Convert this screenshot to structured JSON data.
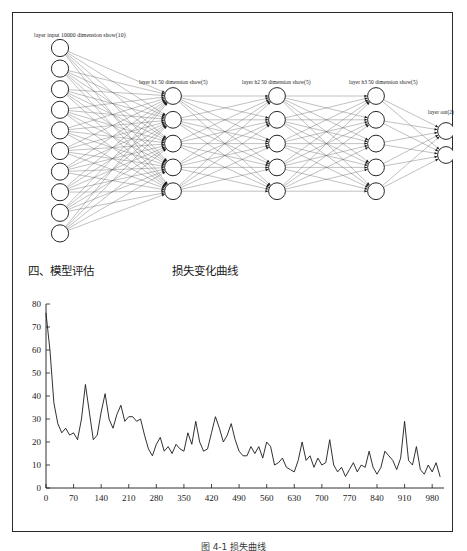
{
  "document": {
    "bottom_caption": "图 4-1  损失曲线"
  },
  "network": {
    "labels": {
      "input": "layer input 10000 dimension show(10)",
      "h1": "layer h1 50 dimension show(5)",
      "h2": "layer h2 50 dimension show(5)",
      "h3": "layer h3 50 dimension show(5)",
      "out": "layer out(2)"
    },
    "layers": [
      {
        "name": "input",
        "node_count": 10,
        "x": 48,
        "y_start": 35,
        "y_step": 20.6,
        "r": 8.6
      },
      {
        "name": "h1",
        "node_count": 5,
        "x": 161,
        "y_start": 83,
        "y_step": 23.8,
        "r": 8.4
      },
      {
        "name": "h2",
        "node_count": 5,
        "x": 265,
        "y_start": 83,
        "y_step": 23.8,
        "r": 8.4
      },
      {
        "name": "h3",
        "node_count": 5,
        "x": 364,
        "y_start": 83,
        "y_step": 23.8,
        "r": 8.4
      },
      {
        "name": "out",
        "node_count": 2,
        "x": 434,
        "y_start": 118,
        "y_step": 24.0,
        "r": 8.4
      }
    ],
    "node_fill": "#ffffff",
    "node_stroke": "#111111",
    "edge_color": "#4a4a4a"
  },
  "headings": {
    "section": "四、模型评估",
    "chart": "损失变化曲线"
  },
  "chart_data": {
    "type": "line",
    "title": "损失变化曲线",
    "xlabel": "",
    "ylabel": "",
    "xlim": [
      0,
      1010
    ],
    "ylim": [
      0,
      80
    ],
    "grid": false,
    "legend": null,
    "xticks": [
      0,
      70,
      140,
      210,
      280,
      350,
      420,
      490,
      560,
      630,
      700,
      770,
      840,
      910,
      980
    ],
    "yticks": [
      0,
      10,
      20,
      30,
      40,
      50,
      60,
      70,
      80
    ],
    "line_color": "#1a1a1a",
    "x": [
      0,
      10,
      20,
      30,
      40,
      50,
      60,
      70,
      80,
      90,
      100,
      110,
      120,
      130,
      140,
      150,
      160,
      170,
      180,
      190,
      200,
      210,
      220,
      230,
      240,
      250,
      260,
      270,
      280,
      290,
      300,
      310,
      320,
      330,
      340,
      350,
      360,
      370,
      380,
      390,
      400,
      410,
      420,
      430,
      440,
      450,
      460,
      470,
      480,
      490,
      500,
      510,
      520,
      530,
      540,
      550,
      560,
      570,
      580,
      590,
      600,
      610,
      620,
      630,
      640,
      650,
      660,
      670,
      680,
      690,
      700,
      710,
      720,
      730,
      740,
      750,
      760,
      770,
      780,
      790,
      800,
      810,
      820,
      830,
      840,
      850,
      860,
      870,
      880,
      890,
      900,
      910,
      920,
      930,
      940,
      950,
      960,
      970,
      980,
      990,
      1000
    ],
    "values": [
      76,
      60,
      37,
      28,
      24,
      26,
      23,
      24,
      21,
      30,
      45,
      33,
      21,
      23,
      33,
      41,
      30,
      26,
      32,
      36,
      29,
      31,
      31,
      29,
      30,
      23,
      17,
      14,
      19,
      22,
      16,
      18,
      15,
      19,
      17,
      16,
      24,
      19,
      29,
      20,
      16,
      17,
      24,
      31,
      26,
      20,
      23,
      28,
      21,
      16,
      14,
      14,
      18,
      15,
      18,
      13,
      20,
      18,
      10,
      11,
      13,
      9,
      8,
      7,
      12,
      20,
      12,
      14,
      9,
      13,
      10,
      11,
      21,
      10,
      7,
      9,
      5,
      8,
      11,
      7,
      10,
      9,
      16,
      9,
      6,
      9,
      16,
      14,
      12,
      8,
      13,
      29,
      12,
      10,
      18,
      8,
      6,
      10,
      7,
      11,
      5
    ]
  }
}
